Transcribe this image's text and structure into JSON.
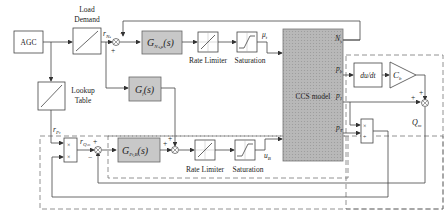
{
  "blocks": {
    "agc": "AGC",
    "load_demand": [
      "Load",
      "Demand"
    ],
    "lookup_table": [
      "Lookup",
      "Table"
    ],
    "g_ns": {
      "main": "G",
      "sub": "Nₛ,μ",
      "arg": "(s)"
    },
    "g_f": {
      "main": "G",
      "sub": "f",
      "arg": "(s)"
    },
    "g_pt": {
      "main": "G",
      "sub": "Pₜ,B",
      "arg": "(s)"
    },
    "rate_limiter_top": "Rate Limiter",
    "saturation_top": "Saturation",
    "rate_limiter_bottom": "Rate Limiter",
    "saturation_bottom": "Saturation",
    "ccs_model": "CCS model",
    "derivative": "du/dt",
    "gain": {
      "main": "C",
      "sub": "b"
    }
  },
  "signals": {
    "r_ns": {
      "main": "r",
      "sub": "Nₛ"
    },
    "mu_t": {
      "main": "μ",
      "sub": "t"
    },
    "n_s": {
      "main": "N",
      "sub": "s"
    },
    "p_b": {
      "main": "p",
      "sub": "b"
    },
    "p_1": {
      "main": "p",
      "sub": "1"
    },
    "p_t": {
      "main": "p",
      "sub": "T"
    },
    "r_pt": {
      "main": "r",
      "sub": "Pₜ"
    },
    "r_q": {
      "main": "r",
      "sub": "Qₘ"
    },
    "u_b": {
      "main": "u",
      "sub": "B"
    },
    "q_m": {
      "main": "Q",
      "sub": "m"
    }
  },
  "signs": {
    "sum1_minus": "−",
    "sum1_plus": "+",
    "sum2_plus_top": "+",
    "sum2_plus_left": "+",
    "sum3_plus": "+",
    "sum3_minus": "−",
    "sum4_plus_top": "+",
    "sum4_plus_left": "+"
  },
  "ops": {
    "mult_top": "×",
    "mult_bottom": "×",
    "div_top": "×",
    "div_bottom": "÷"
  },
  "colors": {
    "block_fill": "#c8c8c8",
    "ccs_fill": "#b4b4b4",
    "line": "#444444",
    "dash": "#777777"
  }
}
